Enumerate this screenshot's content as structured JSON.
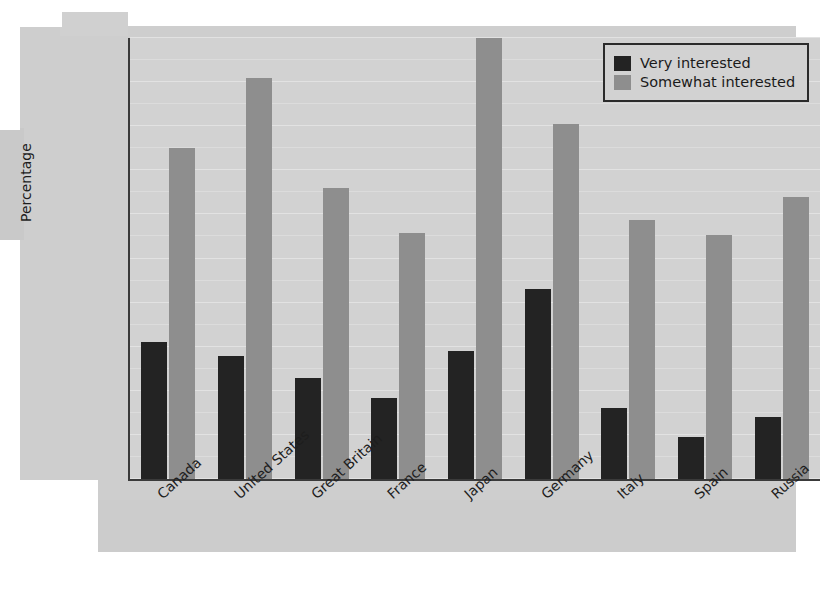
{
  "chart": {
    "ylabel": "Percentage",
    "legend_position": "top-right"
  },
  "chart_data": {
    "type": "bar",
    "title": "",
    "xlabel": "",
    "ylabel": "Percentage",
    "ylim": [
      0,
      50
    ],
    "yticks": [
      0,
      5,
      10,
      15,
      20,
      25,
      30,
      35,
      40,
      45,
      50
    ],
    "grid": true,
    "legend_position": "top-right",
    "categories": [
      "Canada",
      "United States",
      "Great Britain",
      "France",
      "Japan",
      "Germany",
      "Italy",
      "Spain",
      "Russia"
    ],
    "series": [
      {
        "name": "Very interested",
        "color": "#232323",
        "values": [
          15.5,
          13.9,
          11.5,
          9.2,
          14.5,
          21.6,
          8.0,
          4.8,
          7.0
        ]
      },
      {
        "name": "Somewhat interested",
        "color": "#8e8e8e",
        "values": [
          37.5,
          45.5,
          33.0,
          27.9,
          50.0,
          40.2,
          29.4,
          27.7,
          32.0
        ]
      }
    ]
  },
  "colors": {
    "very_interested": "#232323",
    "somewhat_interested": "#8e8e8e",
    "plot_background": "#d2d2d2",
    "page_background": "#cecece",
    "axis": "#3a3a3a"
  }
}
